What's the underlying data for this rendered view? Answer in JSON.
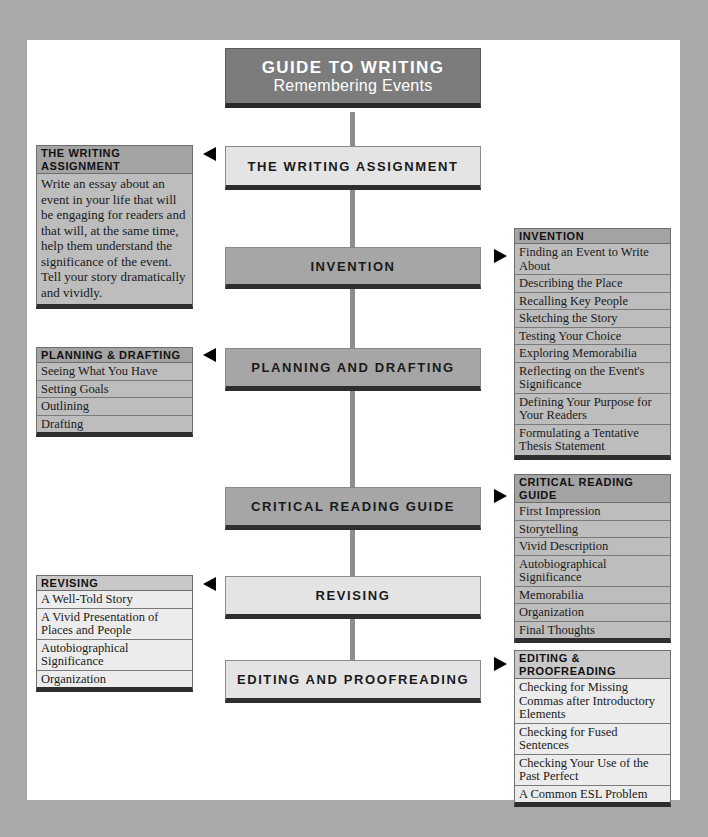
{
  "title": {
    "line1": "GUIDE TO WRITING",
    "line2": "Remembering Events"
  },
  "stages": [
    {
      "label": "THE WRITING ASSIGNMENT"
    },
    {
      "label": "INVENTION"
    },
    {
      "label": "PLANNING AND DRAFTING"
    },
    {
      "label": "CRITICAL READING GUIDE"
    },
    {
      "label": "REVISING"
    },
    {
      "label": "EDITING AND PROOFREADING"
    }
  ],
  "writing_assignment": {
    "header": "THE WRITING ASSIGNMENT",
    "body": "Write an essay about an event in your life that will be engaging for readers and that will, at the same time, help them understand the significance of the event. Tell your story dramatically and vividly."
  },
  "invention": {
    "header": "INVENTION",
    "items": [
      "Finding an Event to Write About",
      "Describing the Place",
      "Recalling Key People",
      "Sketching the Story",
      "Testing Your Choice",
      "Exploring Memorabilia",
      "Reflecting on the Event's Significance",
      "Defining Your Purpose for Your Readers",
      "Formulating a Tentative Thesis Statement"
    ]
  },
  "planning": {
    "header": "PLANNING & DRAFTING",
    "items": [
      "Seeing What You Have",
      "Setting Goals",
      "Outlining",
      "Drafting"
    ]
  },
  "critical_reading": {
    "header": "CRITICAL READING GUIDE",
    "items": [
      "First Impression",
      "Storytelling",
      "Vivid Description",
      "Autobiographical Significance",
      "Memorabilia",
      "Organization",
      "Final Thoughts"
    ]
  },
  "revising": {
    "header": "REVISING",
    "items": [
      "A Well-Told Story",
      "A Vivid Presentation of Places and People",
      "Autobiographical Significance",
      "Organization"
    ]
  },
  "editing": {
    "header": "EDITING & PROOFREADING",
    "items": [
      "Checking for Missing Commas after Introductory Elements",
      "Checking for Fused Sentences",
      "Checking Your Use of the Past Perfect",
      "A Common ESL Problem"
    ]
  },
  "colors": {
    "frame": "#a9a9a9",
    "title_bg": "#7c7c7c",
    "stage_light": "#e4e4e4",
    "stage_dark": "#a6a6a6",
    "spine": "#8e8e8e",
    "shadow": "#2e2e2e"
  }
}
